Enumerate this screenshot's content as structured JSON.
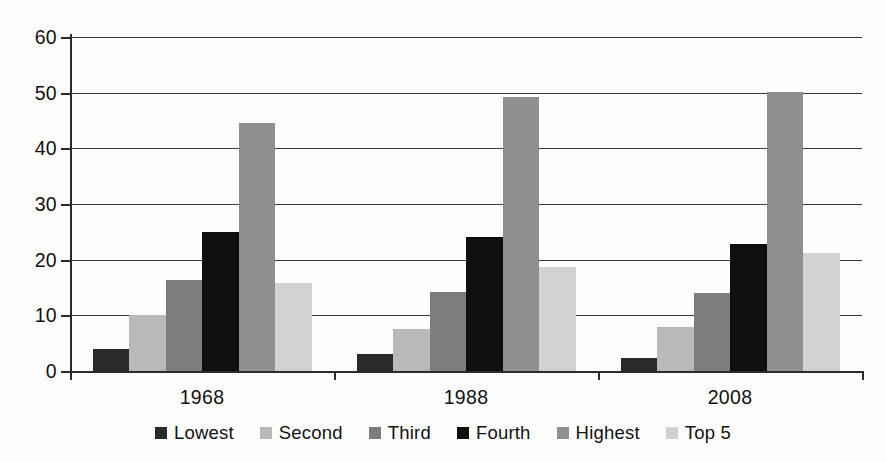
{
  "chart_data": {
    "type": "bar",
    "title": "",
    "subtitle": "",
    "xlabel": "",
    "ylabel": "",
    "categories": [
      "1968",
      "1988",
      "2008"
    ],
    "series": [
      {
        "name": "Lowest",
        "color": "#2a2a2a",
        "values": [
          3.9,
          3.1,
          2.3
        ]
      },
      {
        "name": "Second",
        "color": "#b9b9b9",
        "values": [
          10.1,
          7.5,
          7.9
        ]
      },
      {
        "name": "Third",
        "color": "#7d7d7d",
        "values": [
          16.3,
          14.2,
          14.1
        ]
      },
      {
        "name": "Fourth",
        "color": "#0f0f0f",
        "values": [
          25.0,
          24.0,
          22.8
        ]
      },
      {
        "name": "Highest",
        "color": "#8f8f8f",
        "values": [
          44.5,
          49.3,
          50.2
        ]
      },
      {
        "name": "Top 5",
        "color": "#d2d2d2",
        "values": [
          15.8,
          18.6,
          21.2
        ]
      }
    ],
    "ylim": [
      0,
      60
    ],
    "yticks": [
      0,
      10,
      20,
      30,
      40,
      50,
      60
    ],
    "ytick_labels": [
      "0",
      "10",
      "20",
      "30",
      "40",
      "50",
      "60"
    ],
    "grid": true,
    "grid_axis": "y",
    "legend_position": "bottom",
    "legend_entries": [
      "Lowest",
      "Second",
      "Third",
      "Fourth",
      "Highest",
      "Top 5"
    ],
    "background_color": "#ffffff",
    "axis_color": "#2b2b2b",
    "gridline_color": "#3a3a3a"
  }
}
